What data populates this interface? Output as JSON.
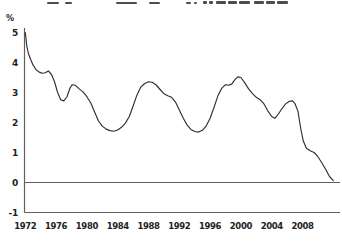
{
  "figure": {
    "percent_label": "%",
    "clipped_title_marks": [
      {
        "x": 47,
        "w": 12,
        "h": 2
      },
      {
        "x": 65,
        "w": 7,
        "h": 2
      },
      {
        "x": 116,
        "w": 21,
        "h": 2
      },
      {
        "x": 149,
        "w": 11,
        "h": 2
      },
      {
        "x": 186,
        "w": 5,
        "h": 2
      },
      {
        "x": 194,
        "w": 3,
        "h": 2
      },
      {
        "x": 203,
        "w": 4,
        "h": 3
      },
      {
        "x": 209,
        "w": 4,
        "h": 3
      },
      {
        "x": 216,
        "w": 10,
        "h": 3
      },
      {
        "x": 228,
        "w": 9,
        "h": 3
      },
      {
        "x": 239,
        "w": 11,
        "h": 3
      },
      {
        "x": 254,
        "w": 10,
        "h": 3
      },
      {
        "x": 266,
        "w": 9,
        "h": 3
      },
      {
        "x": 277,
        "w": 11,
        "h": 3
      }
    ]
  },
  "chart_data": {
    "type": "line",
    "title": "",
    "xlabel": "",
    "ylabel": "%",
    "ylim": [
      -1,
      5
    ],
    "xlim": [
      1972,
      2012.5
    ],
    "grid": false,
    "legend": "none",
    "zero_line": true,
    "x_ticks": [
      1972,
      1976,
      1980,
      1984,
      1988,
      1992,
      1996,
      2000,
      2004,
      2008
    ],
    "y_ticks": [
      -1,
      0,
      1,
      2,
      3,
      4,
      5
    ],
    "line_color": "#2f2f2f",
    "axis_color": "#5f5f5f",
    "series": [
      {
        "name": "growth-rate-line",
        "x": [
          1972.0,
          1972.2,
          1972.4,
          1972.7,
          1973.0,
          1973.4,
          1973.8,
          1974.2,
          1974.6,
          1975.0,
          1975.4,
          1975.8,
          1976.2,
          1976.6,
          1977.0,
          1977.4,
          1977.8,
          1978.1,
          1978.5,
          1979.0,
          1979.5,
          1980.0,
          1980.5,
          1981.0,
          1981.5,
          1982.0,
          1982.5,
          1983.0,
          1983.5,
          1984.0,
          1984.5,
          1985.0,
          1985.5,
          1986.0,
          1986.5,
          1987.0,
          1987.5,
          1988.0,
          1988.5,
          1989.0,
          1989.5,
          1990.0,
          1990.5,
          1991.0,
          1991.5,
          1992.0,
          1992.5,
          1993.0,
          1993.5,
          1994.0,
          1994.5,
          1995.0,
          1995.5,
          1996.0,
          1996.5,
          1997.0,
          1997.5,
          1998.0,
          1998.4,
          1998.8,
          1999.2,
          1999.6,
          2000.0,
          2000.5,
          2001.0,
          2001.5,
          2002.0,
          2002.5,
          2003.0,
          2003.5,
          2004.0,
          2004.4,
          2004.8,
          2005.3,
          2005.8,
          2006.3,
          2006.7,
          2007.0,
          2007.4,
          2007.8,
          2008.1,
          2008.5,
          2009.0,
          2009.5,
          2010.0,
          2010.5,
          2011.0,
          2011.5,
          2012.0
        ],
        "y": [
          5.0,
          4.55,
          4.3,
          4.1,
          3.92,
          3.76,
          3.68,
          3.64,
          3.66,
          3.72,
          3.6,
          3.35,
          3.0,
          2.76,
          2.72,
          2.85,
          3.15,
          3.26,
          3.24,
          3.12,
          3.02,
          2.86,
          2.65,
          2.35,
          2.05,
          1.88,
          1.78,
          1.73,
          1.71,
          1.75,
          1.84,
          1.98,
          2.2,
          2.55,
          2.92,
          3.18,
          3.3,
          3.36,
          3.34,
          3.25,
          3.1,
          2.96,
          2.89,
          2.84,
          2.68,
          2.42,
          2.15,
          1.92,
          1.77,
          1.7,
          1.68,
          1.74,
          1.89,
          2.14,
          2.5,
          2.88,
          3.14,
          3.26,
          3.24,
          3.28,
          3.42,
          3.52,
          3.5,
          3.32,
          3.12,
          2.96,
          2.84,
          2.76,
          2.62,
          2.38,
          2.2,
          2.14,
          2.26,
          2.45,
          2.62,
          2.71,
          2.72,
          2.64,
          2.38,
          1.75,
          1.38,
          1.14,
          1.06,
          1.0,
          0.86,
          0.66,
          0.44,
          0.2,
          0.06
        ]
      }
    ]
  }
}
